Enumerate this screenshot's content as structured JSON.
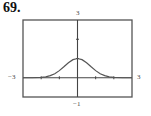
{
  "problem": {
    "number": "69."
  },
  "chart_data": {
    "type": "line",
    "title": "",
    "xlabel": "",
    "ylabel": "",
    "xlim": [
      -3,
      3
    ],
    "ylim": [
      -1,
      3
    ],
    "grid": false,
    "legend": null,
    "window_labels": {
      "xmin": "−3",
      "xmax": "3",
      "ymin": "−1",
      "ymax": "3"
    },
    "x_ticks": [
      -3,
      -2,
      -1,
      0,
      1,
      2,
      3
    ],
    "y_ticks": [
      -1,
      0,
      1,
      2,
      3
    ],
    "series": [
      {
        "name": "f(x)",
        "x": [
          -3,
          -2.5,
          -2,
          -1.75,
          -1.5,
          -1.25,
          -1,
          -0.75,
          -0.5,
          -0.25,
          0,
          0.25,
          0.5,
          0.75,
          1,
          1.25,
          1.5,
          1.75,
          2,
          2.5,
          3
        ],
        "y": [
          0.0,
          0.0,
          0.02,
          0.05,
          0.11,
          0.21,
          0.37,
          0.57,
          0.78,
          0.94,
          1.0,
          0.94,
          0.78,
          0.57,
          0.37,
          0.21,
          0.11,
          0.05,
          0.02,
          0.0,
          0.0
        ]
      }
    ],
    "colors": {
      "frame": "#555555",
      "axis": "#444444",
      "curve": "#555555"
    }
  }
}
